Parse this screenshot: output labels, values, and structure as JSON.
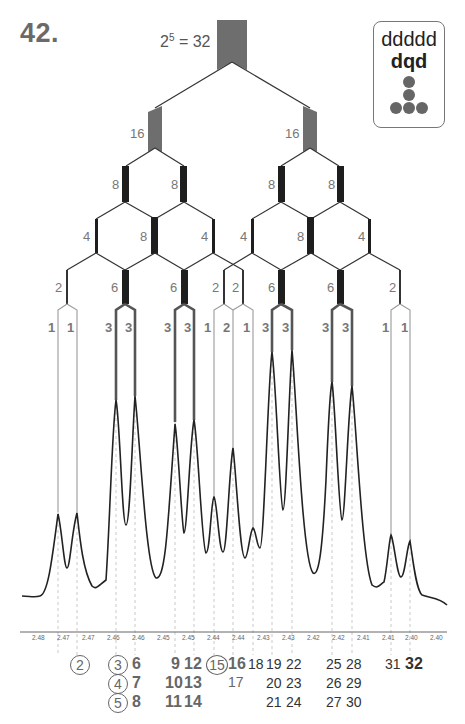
{
  "problem": {
    "number": "42."
  },
  "legend": {
    "pattern": "ddddd",
    "simplified": "dqd",
    "icon": "dot-tree-icon"
  },
  "tree": {
    "top_label_base": "2",
    "top_label_exp": "5",
    "top_label_rest": " = 32",
    "levels": [
      {
        "level": 1,
        "labels": [
          "16",
          "16"
        ]
      },
      {
        "level": 2,
        "labels": [
          "8",
          "8",
          "8",
          "8"
        ]
      },
      {
        "level": 3,
        "labels": [
          "4",
          "8",
          "4",
          "4",
          "8",
          "4"
        ]
      },
      {
        "level": 4,
        "labels": [
          "2",
          "6",
          "6",
          "2",
          "2",
          "6",
          "6",
          "2"
        ]
      },
      {
        "level": 5,
        "labels": [
          "1",
          "1",
          "3",
          "3",
          "3",
          "3",
          "1",
          "2",
          "1",
          "3",
          "3",
          "3",
          "3",
          "1",
          "1"
        ]
      }
    ]
  },
  "axis": {
    "ticks": [
      "2.48",
      "2.47",
      "2.47",
      "2.46",
      "2.46",
      "2.45",
      "2.45",
      "2.44",
      "2.44",
      "2.43",
      "2.43",
      "2.42",
      "2.42",
      "2.41",
      "2.41",
      "2.40",
      "2.40"
    ]
  },
  "line_numbers": {
    "col_a": {
      "r1": "2"
    },
    "col_b": {
      "r1": "3",
      "r2": "4",
      "r3": "5"
    },
    "col_c": {
      "r1": "6",
      "r2": "7",
      "r3": "8"
    },
    "col_d": {
      "r1": "9",
      "r2": "10",
      "r3": "11"
    },
    "col_e": {
      "r1": "12",
      "r2": "13",
      "r3": "14"
    },
    "col_f": {
      "r1": "15"
    },
    "col_g": {
      "r1": "16",
      "r2": "17"
    },
    "col_h": {
      "r1": "18"
    },
    "col_i": {
      "r1": "19",
      "r2": "20",
      "r3": "21"
    },
    "col_j": {
      "r1": "22",
      "r2": "23",
      "r3": "24"
    },
    "col_k": {
      "r1": "25",
      "r2": "26",
      "r3": "27"
    },
    "col_l": {
      "r1": "28",
      "r2": "29",
      "r3": "30"
    },
    "col_m": {
      "r1": "31"
    },
    "col_n": {
      "r1": "32"
    }
  },
  "colors": {
    "stem_gray": "#6e6e6e",
    "stem_black": "#1e1e1e",
    "line": "#333333",
    "light_line": "#9a9a9a",
    "spectrum": "#222222"
  }
}
